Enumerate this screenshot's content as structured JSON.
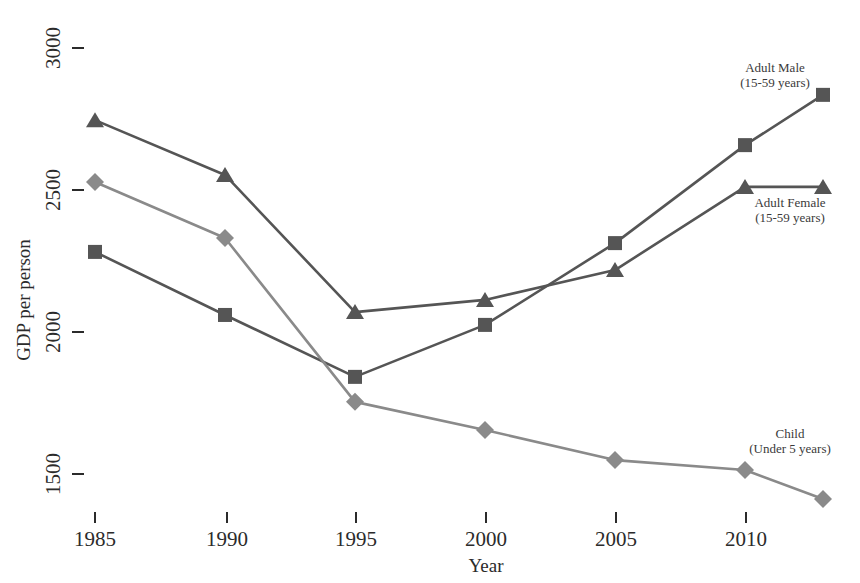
{
  "chart_data": {
    "type": "line",
    "title": "",
    "xlabel": "Year",
    "ylabel": "GDP per person",
    "x": [
      1985,
      1990,
      1995,
      2000,
      2005,
      2010,
      2013
    ],
    "xlim": [
      1983.5,
      2014.5
    ],
    "ylim": [
      1370,
      3060
    ],
    "grid": false,
    "legend_position": "inline-right-of-series",
    "xtick_labels": [
      "1985",
      "1990",
      "1995",
      "2000",
      "2005",
      "2010"
    ],
    "xtick_values": [
      1985,
      1990,
      1995,
      2000,
      2005,
      2010
    ],
    "ytick_labels": [
      "3000",
      "2500",
      "2000",
      "1500"
    ],
    "ytick_values": [
      3000,
      2500,
      2000,
      1500
    ],
    "series": [
      {
        "name": "Adult Male",
        "sublabel": "(15-59 years)",
        "marker": "square",
        "color": "#555555",
        "values": [
          2282,
          2060,
          1842,
          2025,
          2313,
          2658,
          2835
        ]
      },
      {
        "name": "Adult Female",
        "sublabel": "(15-59 years)",
        "marker": "triangle",
        "color": "#555555",
        "values": [
          2746,
          2553,
          2070,
          2113,
          2218,
          2511,
          2511
        ]
      },
      {
        "name": "Child",
        "sublabel": "(Under 5 years)",
        "marker": "diamond",
        "color": "#8a8a8a",
        "values": [
          2528,
          2331,
          1754,
          1655,
          1549,
          1514,
          1412
        ]
      }
    ]
  },
  "axes": {
    "y_title": "GDP per person",
    "x_title": "Year"
  },
  "labels": {
    "adult_male_name": "Adult Male",
    "adult_male_sub": "(15-59 years)",
    "adult_female_name": "Adult Female",
    "adult_female_sub": "(15-59 years)",
    "child_name": "Child",
    "child_sub": "(Under 5 years)"
  },
  "ticks": {
    "y": [
      "3000",
      "2500",
      "2000",
      "1500"
    ],
    "x": [
      "1985",
      "1990",
      "1995",
      "2000",
      "2005",
      "2010"
    ]
  },
  "top_cropped_text": "",
  "colors": {
    "adult_line": "#555555",
    "child_line": "#8a8a8a",
    "text": "#2b2b2b"
  }
}
